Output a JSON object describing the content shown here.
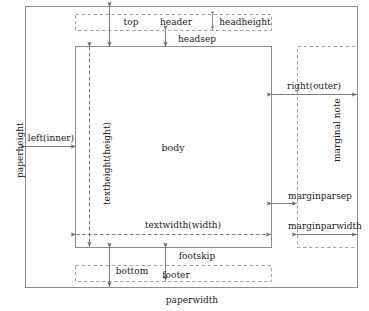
{
  "diagram": {
    "type": "page-layout-diagram",
    "colors": {
      "page_border": "#8c8c8c",
      "body_border": "#8c8c8c",
      "dashed": "#9a9a9a",
      "arrow": "#6e6e6e",
      "text": "#1a1a1a",
      "background": "#ffffff"
    },
    "regions": {
      "body_label": "body",
      "header_label": "header",
      "footer_label": "footer",
      "marginal_note_label": "marginal note"
    },
    "dimensions": {
      "top": "top",
      "headheight": "headheight",
      "headsep": "headsep",
      "left_inner": "left(inner)",
      "right_outer": "right(outer)",
      "textheight": "textheight(height)",
      "textwidth": "textwidth(width)",
      "marginparsep": "marginparsep",
      "marginparwidth": "marginparwidth",
      "footskip": "footskip",
      "bottom": "bottom",
      "paperheight": "paperheight",
      "paperwidth": "paperwidth"
    }
  }
}
